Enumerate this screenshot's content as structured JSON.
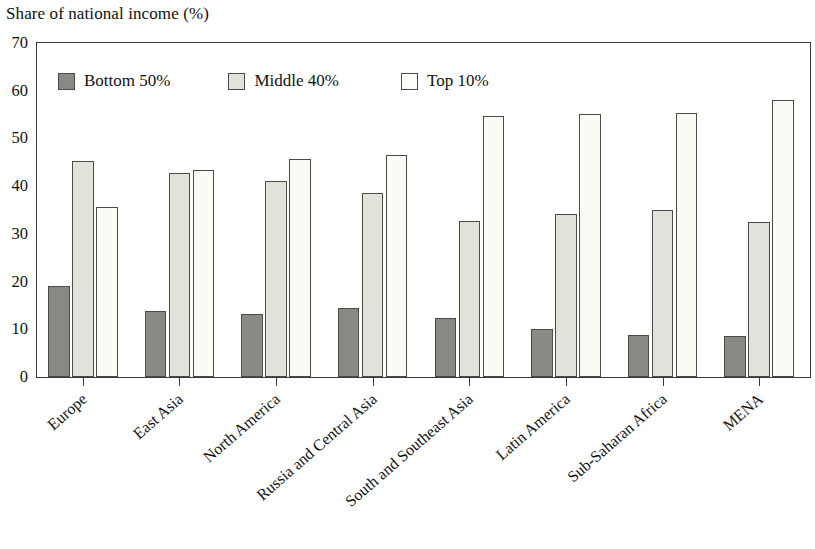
{
  "chart_data": {
    "type": "bar",
    "title": "Share of national income (%)",
    "xlabel": "",
    "ylabel": "",
    "ylim": [
      0,
      70
    ],
    "ytick_step": 10,
    "yticks": [
      0,
      10,
      20,
      30,
      40,
      50,
      60,
      70
    ],
    "grid": false,
    "legend_position": "top-left-inside",
    "categories": [
      "Europe",
      "East Asia",
      "North America",
      "Russia and Central Asia",
      "South and Southeast Asia",
      "Latin America",
      "Sub-Saharan Africa",
      "MENA"
    ],
    "series": [
      {
        "name": "Bottom 50%",
        "color": "#8a8a85",
        "values": [
          19.0,
          13.8,
          13.2,
          14.5,
          12.3,
          10.0,
          8.8,
          8.7
        ]
      },
      {
        "name": "Middle 40%",
        "color": "#e2e2da",
        "values": [
          45.3,
          42.7,
          41.0,
          38.5,
          32.7,
          34.2,
          35.1,
          32.5
        ]
      },
      {
        "name": "Top 10%",
        "color": "#fbfbf6",
        "values": [
          35.6,
          43.3,
          45.6,
          46.5,
          54.6,
          55.1,
          55.3,
          58.0
        ]
      }
    ]
  },
  "colors": {
    "axis": "#3a3a38",
    "bar_outline": "#4a4a47",
    "text": "#111111",
    "background": "#ffffff"
  }
}
